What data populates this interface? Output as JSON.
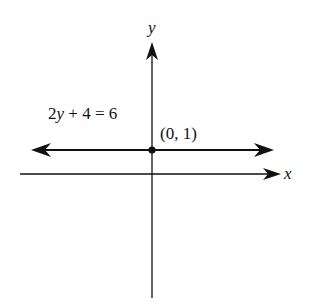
{
  "diagram": {
    "type": "coordinate-plane",
    "colors": {
      "background": "#ffffff",
      "ink": "#111111"
    },
    "axes": {
      "x_label": "x",
      "y_label": "y"
    },
    "line": {
      "equation_parts": {
        "coef": "2",
        "var": "y",
        "rest": " + 4 = 6"
      },
      "equation": "2y + 4 = 6",
      "orientation": "horizontal",
      "arrows": "both ends"
    },
    "point": {
      "label": "(0, 1)",
      "x": 0,
      "y": 1
    }
  }
}
